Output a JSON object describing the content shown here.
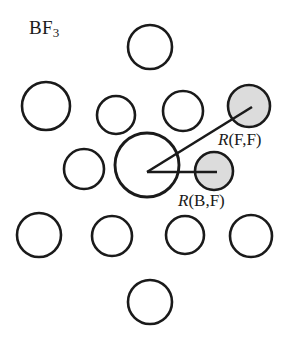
{
  "figure": {
    "name": "bf3-liquid-structure-diagram",
    "width": 295,
    "height": 341,
    "background": "#ffffff",
    "formula": {
      "base": "BF",
      "subscript": "3",
      "full": "BF3"
    },
    "annotations": [
      {
        "id": "r-f-f",
        "symbol": "R",
        "argument": "(F,F)",
        "text": "R(F,F)",
        "meaning": "fluorine-fluorine distance"
      },
      {
        "id": "r-b-f",
        "symbol": "R",
        "argument": "(B,F)",
        "text": "R(B,F)",
        "meaning": "boron-fluorine distance"
      }
    ],
    "colors": {
      "stroke": "#1a1a1a",
      "open_fill": "#ffffff",
      "shaded_fill": "#dcdcdc",
      "text": "#1a1a1a"
    },
    "stroke_width": 2.6,
    "circles": [
      {
        "name": "central-atom-circle",
        "cx": 147,
        "cy": 165,
        "r": 32,
        "fill": "open",
        "role": "central-reference-molecule"
      },
      {
        "name": "top-circle",
        "cx": 150,
        "cy": 47,
        "r": 22,
        "fill": "open",
        "role": "neighbor-molecule"
      },
      {
        "name": "upper-left-circle",
        "cx": 46,
        "cy": 106,
        "r": 24,
        "fill": "open",
        "role": "neighbor-molecule"
      },
      {
        "name": "upper-mid-left-circle",
        "cx": 116,
        "cy": 115,
        "r": 19,
        "fill": "open",
        "role": "neighbor-molecule"
      },
      {
        "name": "upper-mid-right-circle",
        "cx": 183,
        "cy": 111,
        "r": 20,
        "fill": "open",
        "role": "neighbor-molecule"
      },
      {
        "name": "upper-right-shaded-circle",
        "cx": 249,
        "cy": 106,
        "r": 21,
        "fill": "shaded",
        "role": "fluorine-neighbor"
      },
      {
        "name": "mid-left-circle",
        "cx": 84,
        "cy": 169,
        "r": 20,
        "fill": "open",
        "role": "neighbor-molecule"
      },
      {
        "name": "right-shaded-circle",
        "cx": 214,
        "cy": 171,
        "r": 19,
        "fill": "shaded",
        "role": "bonded-fluorine"
      },
      {
        "name": "lower-left-circle",
        "cx": 39,
        "cy": 235,
        "r": 22,
        "fill": "open",
        "role": "neighbor-molecule"
      },
      {
        "name": "lower-mid-left-circle",
        "cx": 112,
        "cy": 236,
        "r": 20,
        "fill": "open",
        "role": "neighbor-molecule"
      },
      {
        "name": "lower-mid-right-circle",
        "cx": 185,
        "cy": 235,
        "r": 19,
        "fill": "open",
        "role": "neighbor-molecule"
      },
      {
        "name": "lower-right-circle",
        "cx": 251,
        "cy": 236,
        "r": 21,
        "fill": "open",
        "role": "neighbor-molecule"
      },
      {
        "name": "bottom-circle",
        "cx": 150,
        "cy": 302,
        "r": 22,
        "fill": "open",
        "role": "neighbor-molecule"
      }
    ],
    "lines": [
      {
        "name": "distance-line-b-f",
        "x1": 147,
        "y1": 172,
        "x2": 216,
        "y2": 172,
        "label": "R(B,F)"
      },
      {
        "name": "distance-line-f-f",
        "x1": 147,
        "y1": 172,
        "x2": 251,
        "y2": 107,
        "label": "R(F,F)"
      }
    ]
  }
}
